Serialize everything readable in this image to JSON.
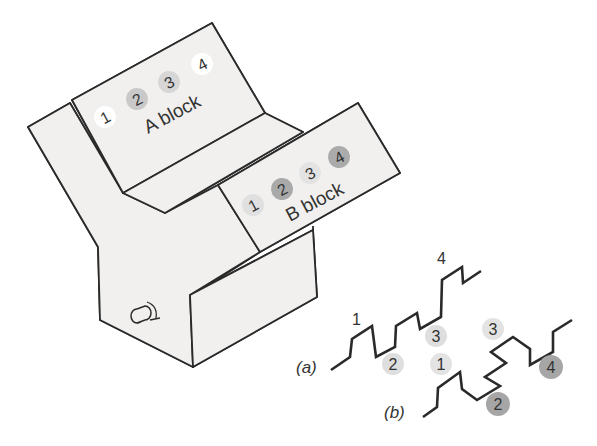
{
  "figure": {
    "a_block": {
      "label": "A block",
      "terminals": [
        {
          "num": "1",
          "fill": "#ffffff"
        },
        {
          "num": "2",
          "fill": "#c9c9c9"
        },
        {
          "num": "3",
          "fill": "#d6d6d6"
        },
        {
          "num": "4",
          "fill": "#ffffff"
        }
      ]
    },
    "b_block": {
      "label": "B block",
      "terminals": [
        {
          "num": "1",
          "fill": "#e0e0e0"
        },
        {
          "num": "2",
          "fill": "#a9a9a9"
        },
        {
          "num": "3",
          "fill": "#e3e3e3"
        },
        {
          "num": "4",
          "fill": "#ababab"
        }
      ]
    },
    "wave_a": {
      "label": "(a)",
      "markers": [
        {
          "num": "1",
          "style": "plain"
        },
        {
          "num": "2",
          "style": "light"
        },
        {
          "num": "3",
          "style": "light"
        },
        {
          "num": "4",
          "style": "plain"
        }
      ]
    },
    "wave_b": {
      "label": "(b)",
      "markers": [
        {
          "num": "1",
          "style": "light"
        },
        {
          "num": "3",
          "style": "light"
        },
        {
          "num": "2",
          "style": "dark"
        },
        {
          "num": "4",
          "style": "dark"
        }
      ]
    },
    "colors": {
      "line": "#2a2a2a",
      "panel": "#f1f0ee",
      "light_dot": "#dedede",
      "dark_dot": "#a6a6a6"
    }
  }
}
